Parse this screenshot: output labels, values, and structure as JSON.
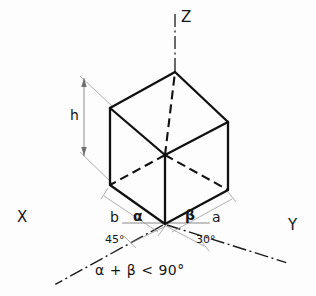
{
  "figure": {
    "type": "technical-line-drawing",
    "background_color": "#fdfdfd",
    "line_color": "#161616"
  },
  "axes": {
    "x_label": "X",
    "y_label": "Y",
    "z_label": "Z",
    "line_style": "dash-dot"
  },
  "dimensions": {
    "height_label": "h",
    "depth_label": "b",
    "width_label": "a"
  },
  "angles": {
    "alpha_symbol": "∠",
    "alpha_greek": "α",
    "beta_greek": "β",
    "alpha_value": "45°",
    "beta_value": "30°"
  },
  "caption": {
    "text": "α + β < 90°",
    "alpha": "α",
    "plus": "+",
    "beta": "β",
    "less_than": "<",
    "limit": "90°"
  },
  "cube_geometry": {
    "top_vertex": [
      175,
      72
    ],
    "top_left_vertex": [
      110,
      108
    ],
    "top_right_vertex": [
      228,
      122
    ],
    "hidden_center_vertex": [
      165,
      155
    ],
    "bottom_left_vertex": [
      110,
      185
    ],
    "origin_vertex": [
      165,
      224
    ],
    "bottom_right_vertex": [
      228,
      190
    ],
    "hidden_edges": "three-dashed-edges-from-center-vertex"
  }
}
